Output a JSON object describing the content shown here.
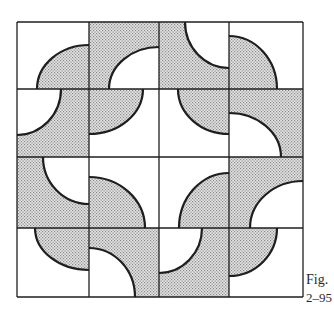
{
  "figure": {
    "caption_line1": "Fig.",
    "caption_line2": "2–95",
    "grid": {
      "rows": 4,
      "cols": 4,
      "col_edges": [
        17,
        89,
        159,
        229,
        303
      ],
      "row_edges": [
        22,
        89,
        157,
        228,
        297
      ]
    },
    "colors": {
      "line": "#1e1e1e",
      "dot": "#8a8a8a",
      "dot_bg": "#e4e4e4",
      "white": "#ffffff"
    },
    "tiles": [
      {
        "row": 0,
        "col": 0,
        "background": "white",
        "quarter_fill": "dotted",
        "corner": "bottom-right",
        "arc_a": 37,
        "arc_b": 45
      },
      {
        "row": 0,
        "col": 1,
        "background": "dotted",
        "quarter_fill": "white",
        "corner": "bottom-right",
        "arc_a": 109,
        "arc_b": 47
      },
      {
        "row": 0,
        "col": 2,
        "background": "dotted",
        "quarter_fill": "white",
        "corner": "top-right",
        "arc_a": 185,
        "arc_b": 68
      },
      {
        "row": 0,
        "col": 3,
        "background": "white",
        "quarter_fill": "dotted",
        "corner": "bottom-left",
        "arc_a": 36,
        "arc_b": 277
      },
      {
        "row": 1,
        "col": 0,
        "background": "dotted",
        "quarter_fill": "white",
        "corner": "top-left",
        "arc_a": 61,
        "arc_b": 135
      },
      {
        "row": 1,
        "col": 1,
        "background": "white",
        "quarter_fill": "dotted",
        "corner": "top-left",
        "arc_a": 143,
        "arc_b": 134
      },
      {
        "row": 1,
        "col": 2,
        "background": "white",
        "quarter_fill": "dotted",
        "corner": "top-right",
        "arc_a": 178,
        "arc_b": 134
      },
      {
        "row": 1,
        "col": 3,
        "background": "dotted",
        "quarter_fill": "white",
        "corner": "bottom-left",
        "arc_a": 113,
        "arc_b": 281
      },
      {
        "row": 2,
        "col": 0,
        "background": "dotted",
        "quarter_fill": "white",
        "corner": "top-right",
        "arc_a": 43,
        "arc_b": 204
      },
      {
        "row": 2,
        "col": 1,
        "background": "white",
        "quarter_fill": "dotted",
        "corner": "bottom-left",
        "arc_a": 177,
        "arc_b": 145
      },
      {
        "row": 2,
        "col": 2,
        "background": "white",
        "quarter_fill": "dotted",
        "corner": "bottom-right",
        "arc_a": 179,
        "arc_b": 173
      },
      {
        "row": 2,
        "col": 3,
        "background": "dotted",
        "quarter_fill": "white",
        "corner": "bottom-right",
        "arc_a": 250,
        "arc_b": 181
      },
      {
        "row": 3,
        "col": 0,
        "background": "white",
        "quarter_fill": "dotted",
        "corner": "top-right",
        "arc_a": 35,
        "arc_b": 270
      },
      {
        "row": 3,
        "col": 1,
        "background": "dotted",
        "quarter_fill": "white",
        "corner": "bottom-left",
        "arc_a": 248,
        "arc_b": 135
      },
      {
        "row": 3,
        "col": 2,
        "background": "dotted",
        "quarter_fill": "white",
        "corner": "top-left",
        "arc_a": 202,
        "arc_b": 273
      },
      {
        "row": 3,
        "col": 3,
        "background": "white",
        "quarter_fill": "dotted",
        "corner": "top-left",
        "arc_a": 277,
        "arc_b": 276
      }
    ]
  }
}
